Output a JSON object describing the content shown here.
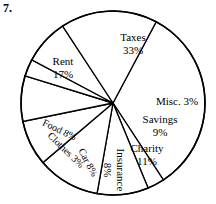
{
  "question_number": "7.",
  "chart_data": {
    "type": "pie",
    "title": "",
    "subtitle": "",
    "xlabel": "",
    "ylabel": "",
    "legend_position": "none",
    "grid": false,
    "units": "percent",
    "total": 100,
    "start_angle_deg": -62,
    "direction": "clockwise",
    "categories": [
      "Taxes",
      "Misc.",
      "Savings",
      "Charity",
      "Insurance",
      "Car",
      "Clothes",
      "Food",
      "Rent"
    ],
    "values": [
      33,
      3,
      9,
      11,
      8,
      8,
      3,
      8,
      17
    ],
    "slices": [
      {
        "label": "Taxes",
        "value": 33,
        "percent_text": "33%",
        "label_lines": [
          "Taxes",
          "33%"
        ],
        "orientation": "horizontal",
        "rotation_deg": 0,
        "label_x": 133,
        "label_y": 44,
        "font": "normal"
      },
      {
        "label": "Misc.",
        "value": 3,
        "percent_text": "3%",
        "label_lines": [
          "Misc. 3%"
        ],
        "orientation": "horizontal",
        "rotation_deg": 0,
        "label_x": 177,
        "label_y": 102,
        "font": "normal"
      },
      {
        "label": "Savings",
        "value": 9,
        "percent_text": "9%",
        "label_lines": [
          "Savings",
          "9%"
        ],
        "orientation": "horizontal",
        "rotation_deg": 0,
        "label_x": 160,
        "label_y": 126,
        "font": "normal"
      },
      {
        "label": "Charity",
        "value": 11,
        "percent_text": "11%",
        "label_lines": [
          "Charity",
          "11%"
        ],
        "orientation": "horizontal",
        "rotation_deg": 0,
        "label_x": 147,
        "label_y": 155,
        "font": "normal"
      },
      {
        "label": "Insurance",
        "value": 8,
        "percent_text": "8%",
        "label_lines": [
          "Insurance",
          "8%"
        ],
        "orientation": "rotated",
        "rotation_deg": 90,
        "label_x": 114,
        "label_y": 170,
        "font": "normal"
      },
      {
        "label": "Car",
        "value": 8,
        "percent_text": "8%",
        "label_lines": [
          "Car 8%"
        ],
        "orientation": "rotated",
        "rotation_deg": 62,
        "label_x": 87,
        "label_y": 163,
        "font": "normal"
      },
      {
        "label": "Clothes",
        "value": 3,
        "percent_text": "3%",
        "label_lines": [
          "Clothes 3%"
        ],
        "orientation": "rotated",
        "rotation_deg": 44,
        "label_x": 65,
        "label_y": 151,
        "font": "normal"
      },
      {
        "label": "Food",
        "value": 8,
        "percent_text": "8%",
        "label_lines": [
          "Food 8%"
        ],
        "orientation": "rotated",
        "rotation_deg": 26,
        "label_x": 59,
        "label_y": 131,
        "font": "normal"
      },
      {
        "label": "Rent",
        "value": 17,
        "percent_text": "17%",
        "label_lines": [
          "Rent",
          "17%"
        ],
        "orientation": "horizontal",
        "rotation_deg": 0,
        "label_x": 63,
        "label_y": 68,
        "font": "normal"
      }
    ],
    "geometry": {
      "center_x": 113,
      "center_y": 103,
      "radius": 92
    },
    "colors": {
      "slice_fill": "#ffffff",
      "slice_stroke": "#000000",
      "text": "#000000",
      "background": "#ffffff"
    }
  }
}
